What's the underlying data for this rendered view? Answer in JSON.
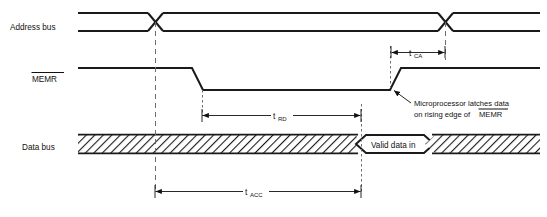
{
  "diagram": {
    "background_color": "#ffffff",
    "waveform_color": "#1a1a1a",
    "guide_color": "#6d6d6d"
  },
  "signals": [
    {
      "id": "address-bus",
      "label": "Address bus",
      "type": "bus"
    },
    {
      "id": "memr",
      "label": "MEMR",
      "overline": true,
      "type": "active-low-strobe"
    },
    {
      "id": "data-bus",
      "label": "Data bus",
      "type": "bus"
    }
  ],
  "bus_content": {
    "valid_data_label": "Valid data in"
  },
  "timings": [
    {
      "id": "t-ca",
      "symbol": "t",
      "subscript": "CA",
      "description": "MEMR rising edge to address change"
    },
    {
      "id": "t-rd",
      "symbol": "t",
      "subscript": "RD",
      "description": "MEMR active low read pulse width"
    },
    {
      "id": "t-acc",
      "symbol": "t",
      "subscript": "ACC",
      "description": "Address valid to data valid access time"
    }
  ],
  "annotation": {
    "line1": "Microprocessor latches data",
    "line2_prefix": "on rising edge of ",
    "line2_signal": "MEMR"
  }
}
